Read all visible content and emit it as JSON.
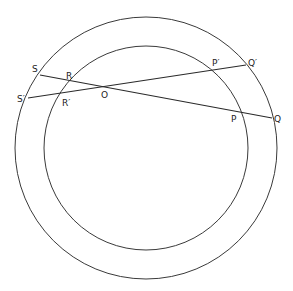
{
  "diagram": {
    "type": "concentric-circles-with-secants",
    "circles": [
      {
        "name": "outer",
        "cx": 146,
        "cy": 148,
        "r": 131
      },
      {
        "name": "inner",
        "cx": 146,
        "cy": 148,
        "r": 102
      }
    ],
    "lines": [
      {
        "name": "SQ",
        "from": [
          40,
          75
        ],
        "to": [
          272,
          118
        ]
      },
      {
        "name": "S'Q'",
        "from": [
          28,
          98
        ],
        "to": [
          246,
          65
        ]
      }
    ],
    "labels": {
      "S": "S",
      "S_prime": "S′",
      "R": "R",
      "R_prime": "R′",
      "O": "O",
      "P": "P",
      "P_prime": "P′",
      "Q": "Q",
      "Q_prime": "Q′"
    },
    "colors": {
      "stroke": "#2a2a2a",
      "background": "#ffffff"
    }
  }
}
